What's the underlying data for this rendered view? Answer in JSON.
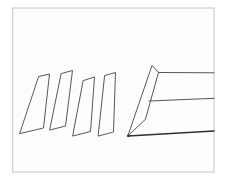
{
  "page": {
    "background_color": "#ffffff"
  },
  "drawing": {
    "frame": {
      "x": 12.7,
      "y": 8,
      "width": 201.3,
      "height": 164,
      "stroke": "#c6c6c6",
      "fill": "#fdfdfd"
    },
    "stroke_color": "#575757",
    "dark_stroke_color": "#2f2f2f",
    "slices": [
      {
        "name": "slice-1",
        "points": "39,76.5 49.5,74 43.5,128 20,133.5"
      },
      {
        "name": "slice-2",
        "points": "61.5,73.5 72.5,70.5 65.5,126 50,130"
      },
      {
        "name": "slice-3",
        "points": "83.5,80.5 94.5,77 90.5,131.5 73,136"
      },
      {
        "name": "slice-4",
        "points": "105,75.5 115.5,72.5 113.5,132 98.5,136"
      }
    ],
    "loaf": {
      "end_face_points": "128,135.5 152,65.5 158.5,72.5 145.5,119",
      "top_edge_points": "158.5,72.5 214,72.8",
      "middle_edge_points": "149,101 214,98.3",
      "bottom_edge_points": "128,136 214,131",
      "tip": {
        "cx": 128.3,
        "cy": 135.7,
        "r": 1.3
      }
    }
  }
}
